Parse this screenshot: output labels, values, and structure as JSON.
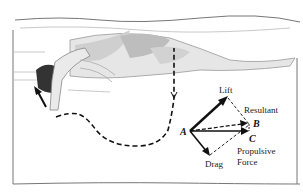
{
  "figure": {
    "vectors": {
      "lift": "Lift",
      "resultant": "Resultant",
      "drag": "Drag",
      "propulsive_line1": "Propulsive",
      "propulsive_line2": "Force"
    },
    "points": {
      "a": "A",
      "b": "B",
      "c": "C"
    }
  }
}
